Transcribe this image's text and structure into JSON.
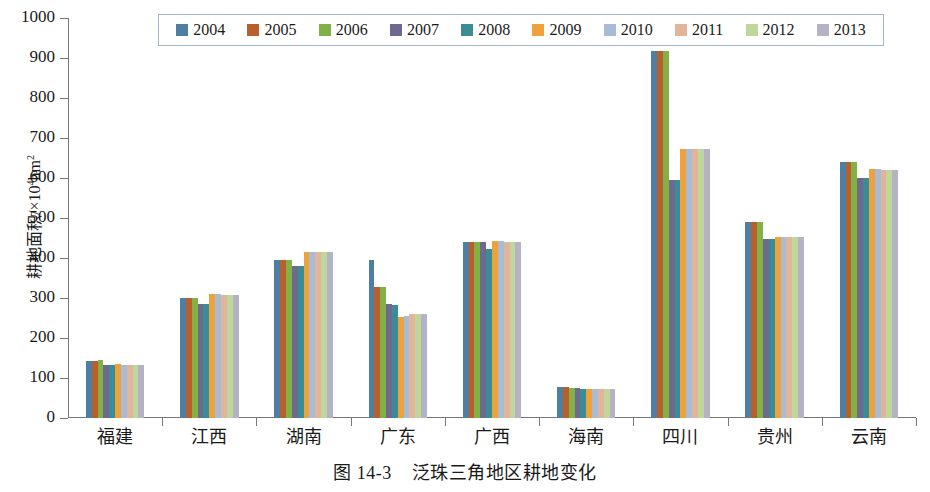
{
  "chart_data": {
    "type": "bar",
    "title": "",
    "caption_number": "图 14-3",
    "caption_text": "泛珠三角地区耕地变化",
    "xlabel": "",
    "ylabel": "耕地面积/×10⁴hm²",
    "ylabel_parts": {
      "prefix": "耕地面积/×10",
      "exponent": "4",
      "suffix": "hm",
      "unit_exponent": "2"
    },
    "ylim": [
      0,
      1000
    ],
    "ytick_labels": [
      "1000",
      "900",
      "800",
      "700",
      "600",
      "500",
      "400",
      "300",
      "200",
      "100",
      "0"
    ],
    "ytick_values": [
      1000,
      900,
      800,
      700,
      600,
      500,
      400,
      300,
      200,
      100,
      0
    ],
    "grid": false,
    "legend_position": "top",
    "categories": [
      "福建",
      "江西",
      "湖南",
      "广东",
      "广西",
      "海南",
      "四川",
      "贵州",
      "云南"
    ],
    "series": [
      {
        "name": "2004",
        "color": "#4f7ea3",
        "values": [
          143,
          299,
          394,
          394,
          441,
          77,
          917,
          489,
          641
        ]
      },
      {
        "name": "2005",
        "color": "#b85f2b",
        "values": [
          143,
          300,
          394,
          327,
          441,
          77,
          917,
          489,
          641
        ]
      },
      {
        "name": "2006",
        "color": "#82b246",
        "values": [
          145,
          299,
          394,
          327,
          441,
          76,
          917,
          491,
          641
        ]
      },
      {
        "name": "2007",
        "color": "#6e6a8f",
        "values": [
          132,
          284,
          379,
          285,
          441,
          75,
          594,
          448,
          601
        ]
      },
      {
        "name": "2008",
        "color": "#3a8c96",
        "values": [
          133,
          284,
          380,
          283,
          422,
          73,
          594,
          448,
          601
        ]
      },
      {
        "name": "2009",
        "color": "#efa13c",
        "values": [
          134,
          310,
          414,
          253,
          443,
          73,
          672,
          453,
          623
        ]
      },
      {
        "name": "2010",
        "color": "#a9bcd6",
        "values": [
          133,
          309,
          414,
          256,
          442,
          73,
          672,
          453,
          622
        ]
      },
      {
        "name": "2011",
        "color": "#e2b49a",
        "values": [
          133,
          308,
          414,
          260,
          441,
          72,
          672,
          453,
          621
        ]
      },
      {
        "name": "2012",
        "color": "#bed79a",
        "values": [
          133,
          308,
          414,
          261,
          441,
          72,
          672,
          452,
          619
        ]
      },
      {
        "name": "2013",
        "color": "#b4b2c4",
        "values": [
          133,
          308,
          414,
          261,
          441,
          72,
          672,
          452,
          619
        ]
      }
    ],
    "legend_border_color": "#9fb6cc",
    "axis_color": "#777777"
  }
}
